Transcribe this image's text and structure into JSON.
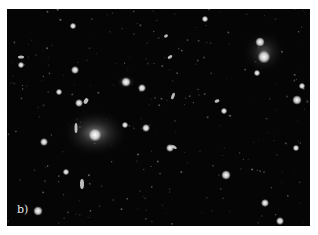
{
  "figure": {
    "panel_label": "b)",
    "background_color": "#050505",
    "objects": [
      {
        "type": "glow",
        "cx": 95,
        "cy": 133,
        "rx": 34,
        "ry": 24,
        "o": 0.55
      },
      {
        "type": "core",
        "cx": 95,
        "cy": 135,
        "r": 4
      },
      {
        "type": "glow",
        "cx": 264,
        "cy": 52,
        "rx": 22,
        "ry": 22,
        "o": 0.35
      },
      {
        "type": "core",
        "cx": 264,
        "cy": 57,
        "r": 4
      },
      {
        "type": "core",
        "cx": 260,
        "cy": 42,
        "r": 3
      },
      {
        "type": "glow",
        "cx": 126,
        "cy": 82,
        "rx": 10,
        "ry": 7,
        "o": 0.45
      },
      {
        "type": "core",
        "cx": 126,
        "cy": 82,
        "r": 3
      },
      {
        "type": "core",
        "cx": 142,
        "cy": 88,
        "r": 2.5
      },
      {
        "type": "core",
        "cx": 75,
        "cy": 70,
        "r": 2.5
      },
      {
        "type": "core",
        "cx": 59,
        "cy": 92,
        "r": 2
      },
      {
        "type": "core",
        "cx": 79,
        "cy": 103,
        "r": 2.5
      },
      {
        "type": "core",
        "cx": 125,
        "cy": 125,
        "r": 2
      },
      {
        "type": "core",
        "cx": 146,
        "cy": 128,
        "r": 2.5
      },
      {
        "type": "core",
        "cx": 170,
        "cy": 148,
        "r": 2.5
      },
      {
        "type": "core",
        "cx": 226,
        "cy": 175,
        "r": 3
      },
      {
        "type": "core",
        "cx": 280,
        "cy": 221,
        "r": 2.5
      },
      {
        "type": "core",
        "cx": 297,
        "cy": 100,
        "r": 3
      },
      {
        "type": "core",
        "cx": 302,
        "cy": 86,
        "r": 2
      },
      {
        "type": "core",
        "cx": 257,
        "cy": 73,
        "r": 2
      },
      {
        "type": "core",
        "cx": 265,
        "cy": 203,
        "r": 2.5
      },
      {
        "type": "core",
        "cx": 38,
        "cy": 211,
        "r": 3
      },
      {
        "type": "core",
        "cx": 44,
        "cy": 142,
        "r": 2.5
      },
      {
        "type": "core",
        "cx": 66,
        "cy": 172,
        "r": 2
      },
      {
        "type": "core",
        "cx": 73,
        "cy": 26,
        "r": 2
      },
      {
        "type": "core",
        "cx": 21,
        "cy": 65,
        "r": 2
      },
      {
        "type": "core",
        "cx": 205,
        "cy": 19,
        "r": 2
      },
      {
        "type": "core",
        "cx": 224,
        "cy": 111,
        "r": 2
      },
      {
        "type": "core",
        "cx": 190,
        "cy": 232,
        "r": 2
      },
      {
        "type": "core",
        "cx": 296,
        "cy": 148,
        "r": 2
      },
      {
        "type": "ellipse",
        "cx": 82,
        "cy": 184,
        "rx": 2,
        "ry": 5,
        "rot": 0
      },
      {
        "type": "ellipse",
        "cx": 76,
        "cy": 128,
        "rx": 1.5,
        "ry": 5,
        "rot": 0
      },
      {
        "type": "ellipse",
        "cx": 170,
        "cy": 57,
        "rx": 2.5,
        "ry": 1.5,
        "rot": -30
      },
      {
        "type": "ellipse",
        "cx": 217,
        "cy": 101,
        "rx": 2.5,
        "ry": 1.5,
        "rot": -20
      },
      {
        "type": "ellipse",
        "cx": 173,
        "cy": 96,
        "rx": 1.5,
        "ry": 3.5,
        "rot": 20
      },
      {
        "type": "ellipse",
        "cx": 174,
        "cy": 147,
        "rx": 3,
        "ry": 1.5,
        "rot": 30
      },
      {
        "type": "ellipse",
        "cx": 166,
        "cy": 36,
        "rx": 2,
        "ry": 1.5,
        "rot": -30
      },
      {
        "type": "ellipse",
        "cx": 21,
        "cy": 57,
        "rx": 3,
        "ry": 1.5,
        "rot": 0
      },
      {
        "type": "ellipse",
        "cx": 86,
        "cy": 101,
        "rx": 2,
        "ry": 3,
        "rot": 30
      }
    ]
  }
}
